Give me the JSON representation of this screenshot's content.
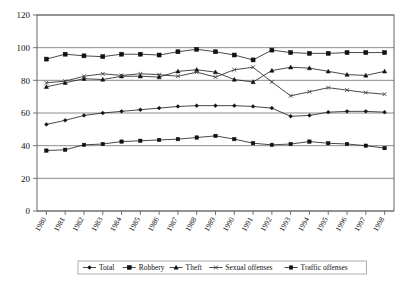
{
  "chart_data": {
    "type": "line",
    "title": "",
    "subtitle": "",
    "xlabel": "",
    "ylabel": "",
    "ylim": [
      0,
      120
    ],
    "yticks": [
      0,
      20,
      40,
      60,
      80,
      100,
      120
    ],
    "grid": true,
    "legend_position": "bottom",
    "categories": [
      "1980",
      "1981",
      "1982",
      "1983",
      "1984",
      "1985",
      "1986",
      "1987",
      "1988",
      "1989",
      "1990",
      "1991",
      "1992",
      "1993",
      "1994",
      "1995",
      "1996",
      "1997",
      "1998"
    ],
    "series": [
      {
        "name": "Total",
        "marker": "diamond",
        "values": [
          53,
          55.5,
          58.5,
          60,
          61,
          62,
          63,
          64,
          64.5,
          64.5,
          64.5,
          64,
          63,
          58,
          58.5,
          60.5,
          61,
          61,
          60.5
        ]
      },
      {
        "name": "Robbery",
        "marker": "square",
        "values": [
          93,
          96,
          95,
          94.5,
          96,
          96,
          95.5,
          97.5,
          99,
          97.5,
          95.5,
          92.5,
          98.5,
          97,
          96.5,
          96.5,
          97,
          97,
          97
        ]
      },
      {
        "name": "Theft",
        "marker": "triangle",
        "values": [
          76,
          78.5,
          81,
          80.5,
          82.5,
          82.5,
          82,
          85.5,
          86.5,
          85,
          80.5,
          79,
          86,
          88,
          87.5,
          85.5,
          83.5,
          83,
          85.5
        ]
      },
      {
        "name": "Sexual offenses",
        "marker": "x",
        "values": [
          78.5,
          79.5,
          82.5,
          84,
          83,
          84,
          83.5,
          82.5,
          85,
          82,
          86.5,
          88,
          79,
          70.5,
          73,
          75.5,
          74,
          72.5,
          71.5
        ]
      },
      {
        "name": "Traffic offenses",
        "marker": "square-small",
        "values": [
          37,
          37.5,
          40.5,
          41,
          42.5,
          43,
          43.5,
          44,
          45,
          46,
          44,
          41.5,
          40.5,
          41,
          42.5,
          41.5,
          41,
          40,
          38.5
        ]
      }
    ]
  },
  "legend": {
    "items": [
      {
        "label": "Total"
      },
      {
        "label": "Robbery"
      },
      {
        "label": "Theft"
      },
      {
        "label": "Sexual offenses"
      },
      {
        "label": "Traffic offenses"
      }
    ]
  }
}
